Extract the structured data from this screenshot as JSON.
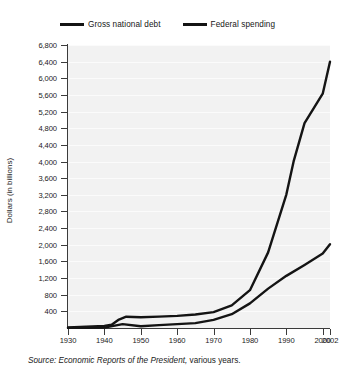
{
  "chart_data": {
    "type": "line",
    "title": "",
    "xlabel": "",
    "ylabel": "Dollars (in billions)",
    "xlim": [
      1930,
      2002
    ],
    "ylim": [
      0,
      6800
    ],
    "grid": true,
    "legend_position": "top",
    "x_tick_labels": [
      "1930",
      "1940",
      "1950",
      "1960",
      "1970",
      "1980",
      "1990",
      "2000",
      "2002"
    ],
    "x_ticks": [
      1930,
      1940,
      1950,
      1960,
      1970,
      1980,
      1990,
      2000,
      2002
    ],
    "y_tick_labels": [
      "400",
      "800",
      "1,200",
      "1,600",
      "2,000",
      "2,400",
      "2,800",
      "3,200",
      "3,600",
      "4,000",
      "4,400",
      "4,800",
      "5,200",
      "5,600",
      "6,000",
      "6,400",
      "6,800"
    ],
    "y_ticks": [
      400,
      800,
      1200,
      1600,
      2000,
      2400,
      2800,
      3200,
      3600,
      4000,
      4400,
      4800,
      5200,
      5600,
      6000,
      6400,
      6800
    ],
    "series": [
      {
        "name": "Gross national debt",
        "color": "#141414",
        "x": [
          1930,
          1935,
          1940,
          1942,
          1944,
          1946,
          1950,
          1955,
          1960,
          1965,
          1970,
          1975,
          1980,
          1985,
          1990,
          1992,
          1995,
          2000,
          2002
        ],
        "values": [
          16,
          29,
          51,
          79,
          204,
          271,
          257,
          274,
          291,
          323,
          381,
          542,
          909,
          1817,
          3207,
          4002,
          4921,
          5629,
          6400
        ]
      },
      {
        "name": "Federal spending",
        "color": "#141414",
        "x": [
          1930,
          1935,
          1940,
          1945,
          1950,
          1955,
          1960,
          1965,
          1970,
          1975,
          1980,
          1985,
          1990,
          1995,
          2000,
          2002
        ],
        "values": [
          3,
          6,
          9,
          93,
          43,
          68,
          92,
          118,
          196,
          332,
          591,
          946,
          1253,
          1516,
          1789,
          2011
        ]
      }
    ],
    "annotations": []
  },
  "legend": {
    "entries": [
      {
        "label": "Gross national debt",
        "icon": "line-swatch-icon"
      },
      {
        "label": "Federal spending",
        "icon": "line-swatch-icon"
      }
    ]
  },
  "source_note": {
    "prefix": "Source: Economic Reports of the President,",
    "suffix": " various years."
  }
}
